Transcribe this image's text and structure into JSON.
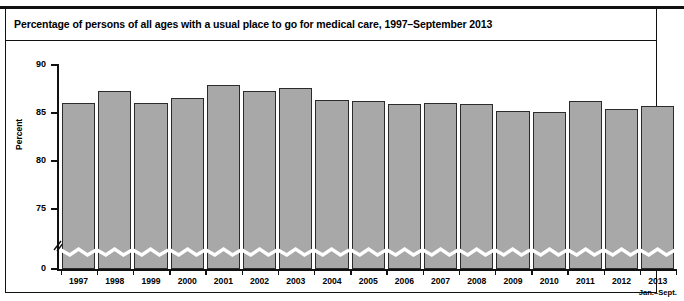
{
  "figure": {
    "title": "Percentage of persons of all ages with a usual place to go for medical care, 1997–September 2013",
    "axis_title": "Percent",
    "bar_fill_color": "#a8a8a8",
    "bar_stroke_color": "#2b2b2b",
    "axis_color": "#111111"
  },
  "chart_data": {
    "type": "bar",
    "title": "Percentage of persons of all ages with a usual place to go for medical care, 1997–September 2013",
    "xlabel": "",
    "ylabel": "Percent",
    "ylim": [
      0,
      90
    ],
    "yticks": [
      0,
      75,
      80,
      85,
      90
    ],
    "ytick_labels": [
      "0",
      "75",
      "80",
      "85",
      "90"
    ],
    "axis_break": true,
    "axis_break_note": "y-axis broken between 0 and 75; each bar drawn with a zigzag break near the baseline",
    "grid": false,
    "legend": null,
    "categories": [
      "1997",
      "1998",
      "1999",
      "2000",
      "2001",
      "2002",
      "2003",
      "2004",
      "2005",
      "2006",
      "2007",
      "2008",
      "2009",
      "2010",
      "2011",
      "2012",
      "2013"
    ],
    "category_sublabels": [
      "",
      "",
      "",
      "",
      "",
      "",
      "",
      "",
      "",
      "",
      "",
      "",
      "",
      "",
      "",
      "",
      "Jan.–Sept."
    ],
    "values": [
      86.0,
      87.3,
      86.0,
      86.6,
      87.9,
      87.3,
      87.6,
      86.4,
      86.3,
      85.9,
      86.0,
      85.9,
      85.2,
      85.1,
      86.3,
      85.4,
      85.7
    ],
    "series": [
      {
        "name": "Percentage with a usual place to go for medical care",
        "values": [
          86.0,
          87.3,
          86.0,
          86.6,
          87.9,
          87.3,
          87.6,
          86.4,
          86.3,
          85.9,
          86.0,
          85.9,
          85.2,
          85.1,
          86.3,
          85.4,
          85.7
        ]
      }
    ]
  }
}
